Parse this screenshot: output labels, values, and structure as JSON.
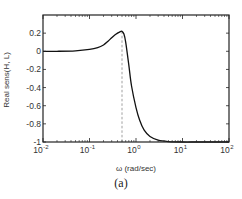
{
  "chart_data": {
    "type": "line",
    "title": "",
    "xlabel": "ω (rad/sec)",
    "ylabel": "Real sens(H, L)",
    "xscale": "log",
    "xlim": [
      0.01,
      100
    ],
    "ylim": [
      -1,
      0.4
    ],
    "xticks": [
      {
        "base": "10",
        "exp": "-2",
        "value": 0.01
      },
      {
        "base": "10",
        "exp": "-1",
        "value": 0.1
      },
      {
        "base": "10",
        "exp": "0",
        "value": 1
      },
      {
        "base": "10",
        "exp": "1",
        "value": 10
      },
      {
        "base": "10",
        "exp": "2",
        "value": 100
      }
    ],
    "yticks": [
      "0.2",
      "0",
      "-0.2",
      "-0.4",
      "-0.6",
      "-0.8",
      "-1"
    ],
    "ytick_values": [
      0.2,
      0,
      -0.2,
      -0.4,
      -0.6,
      -0.8,
      -1
    ],
    "grid": false,
    "legend": null,
    "series": [
      {
        "name": "Real sens(H, L)",
        "x": [
          0.01,
          0.02,
          0.05,
          0.1,
          0.15,
          0.2,
          0.25,
          0.3,
          0.35,
          0.4,
          0.45,
          0.5,
          0.55,
          0.6,
          0.7,
          0.8,
          1.0,
          1.2,
          1.5,
          2.0,
          3.0,
          5.0,
          10,
          20,
          50,
          100
        ],
        "values": [
          0.0,
          0.0,
          0.005,
          0.02,
          0.04,
          0.07,
          0.11,
          0.15,
          0.18,
          0.2,
          0.215,
          0.22,
          0.19,
          0.1,
          -0.15,
          -0.38,
          -0.62,
          -0.76,
          -0.87,
          -0.94,
          -0.98,
          -0.995,
          -1.0,
          -1.0,
          -1.0,
          -1.0
        ]
      }
    ],
    "annotations": [
      {
        "type": "vertical-dashed-line",
        "x": 0.5,
        "from_y": -1,
        "to_y": 0.22
      }
    ]
  },
  "caption": "(a)"
}
